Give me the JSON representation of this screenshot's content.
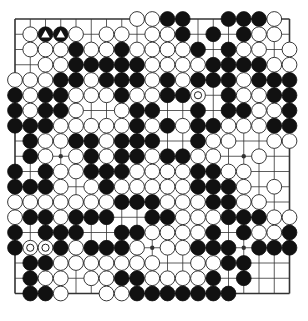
{
  "board": {
    "size": 19,
    "origin_x": 15,
    "origin_y": 19,
    "spacing": 15.25,
    "stone_radius": 7.4,
    "line_color": "#333333",
    "black_color": "#111111",
    "white_color": "#ffffff",
    "hoshi": [
      [
        3,
        3
      ],
      [
        3,
        9
      ],
      [
        3,
        15
      ],
      [
        9,
        3
      ],
      [
        9,
        9
      ],
      [
        9,
        15
      ],
      [
        15,
        3
      ],
      [
        15,
        9
      ],
      [
        15,
        15
      ]
    ],
    "rows": [
      "........WWBB..BBBW.",
      ".WBBW.WW.WWB.B.BWW.",
      ".WWWBWWBWWWWB.BWW.W",
      "..WWBBBBBWWWWBBBBWW",
      "WWWBBWBBBWBWBBBWBBB",
      "BWBBWWWBWWBBW.BWWBB",
      "BWBBW..WBB..B.BBWWB",
      "BBBWWWWWBWBWBBWWWBB",
      ".BWWBBWBBB..BWW..WW",
      ".BW.WBWBBWBBWW..W..",
      "B.BWWBBBWWWWBBWW...",
      "BBBW.WBWWWWWBBBW.W.",
      "WWWWWWWBBBWWWBBWW..",
      "WBBWBBB..BBWWWBBBWW",
      "B.BBB..BBWWWWB.BWWB",
      "BWWBWBBBW.WWBBB.BBB",
      ".BBWWWWWWW..WWBB...",
      ".BWW.WWBBWWWWB.B...",
      ".BBW..WWBBBBBBB...."
    ],
    "markers": [
      {
        "row": 1,
        "col": 2,
        "type": "triangle"
      },
      {
        "row": 1,
        "col": 3,
        "type": "triangle"
      },
      {
        "row": 5,
        "col": 12,
        "type": "circle"
      },
      {
        "row": 15,
        "col": 1,
        "type": "circle"
      },
      {
        "row": 15,
        "col": 2,
        "type": "circle"
      }
    ]
  }
}
